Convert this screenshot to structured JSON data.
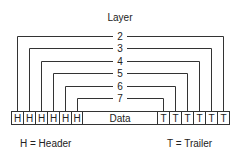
{
  "diagram": {
    "title": "Layer",
    "layers": [
      {
        "number": "2"
      },
      {
        "number": "3"
      },
      {
        "number": "4"
      },
      {
        "number": "5"
      },
      {
        "number": "6"
      },
      {
        "number": "7"
      }
    ],
    "headers": [
      "H",
      "H",
      "H",
      "H",
      "H",
      "H"
    ],
    "data_label": "Data",
    "trailers": [
      "T",
      "T",
      "T",
      "T",
      "T",
      "T"
    ],
    "legend": {
      "header": "H = Header",
      "trailer": "T = Trailer"
    }
  }
}
